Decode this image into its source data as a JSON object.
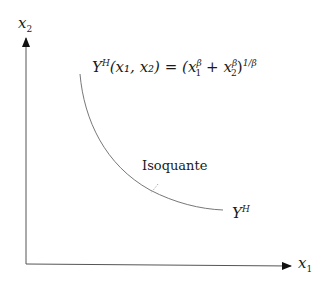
{
  "diagram": {
    "type": "isoquant-plot",
    "axes": {
      "y_label_var": "x",
      "y_label_sub": "2",
      "x_label_var": "x",
      "x_label_sub": "1"
    },
    "equation": {
      "lhs_Y": "Y",
      "lhs_sup": "H",
      "lhs_args": "(x₁, x₂) = (",
      "x1": "x",
      "x1_sub": "1",
      "beta": "β",
      "plus": " + ",
      "x2": "x",
      "x2_sub": "2",
      "close": ")",
      "outer_exp": "1/β"
    },
    "curve_label": "Isoquante",
    "curve_end_label_Y": "Y",
    "curve_end_label_sup": "H",
    "colors": {
      "axis": "#555555",
      "curve": "#777777",
      "text": "#1a1a1a"
    }
  }
}
